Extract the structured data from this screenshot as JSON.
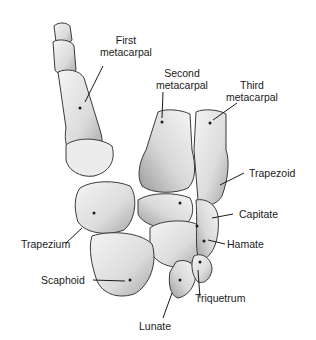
{
  "diagram": {
    "colors": {
      "background": "#ffffff",
      "bone_fill": "#e4e4e4",
      "bone_light": "#f2f2f2",
      "bone_shadow": "#9a9a9a",
      "outline": "#3a3a3a",
      "text": "#1a1a1a",
      "leader": "#1a1a1a"
    },
    "labels": [
      {
        "id": "first-metacarpal",
        "lines": [
          "First",
          "metacarpal"
        ]
      },
      {
        "id": "second-metacarpal",
        "lines": [
          "Second",
          "metacarpal"
        ]
      },
      {
        "id": "third-metacarpal",
        "lines": [
          "Third",
          "metacarpal"
        ]
      },
      {
        "id": "trapezoid",
        "lines": [
          "Trapezoid"
        ]
      },
      {
        "id": "capitate",
        "lines": [
          "Capitate"
        ]
      },
      {
        "id": "hamate",
        "lines": [
          "Hamate"
        ]
      },
      {
        "id": "trapezium",
        "lines": [
          "Trapezium"
        ]
      },
      {
        "id": "scaphoid",
        "lines": [
          "Scaphoid"
        ]
      },
      {
        "id": "triquetrum",
        "lines": [
          "Triquetrum"
        ]
      },
      {
        "id": "lunate",
        "lines": [
          "Lunate"
        ]
      }
    ]
  }
}
